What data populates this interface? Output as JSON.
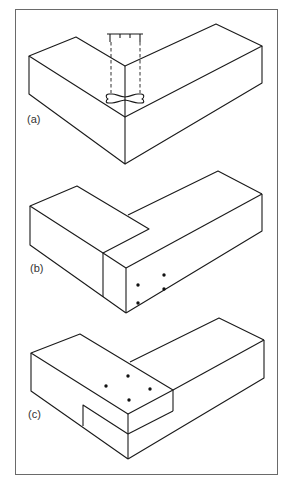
{
  "figure": {
    "panels": [
      {
        "id": "a",
        "label": "(a)",
        "description": "Mitred corner joint with dovetail key/clamp shown dashed"
      },
      {
        "id": "b",
        "label": "(b)",
        "description": "Lapped corner joint, pinned through end face (4 dots)"
      },
      {
        "id": "c",
        "label": "(c)",
        "description": "Lapped corner joint, pinned through top face (4 dots)"
      }
    ],
    "colors": {
      "line": "#1a1a1a",
      "frame": "#6a6a6a",
      "background": "#ffffff"
    }
  }
}
